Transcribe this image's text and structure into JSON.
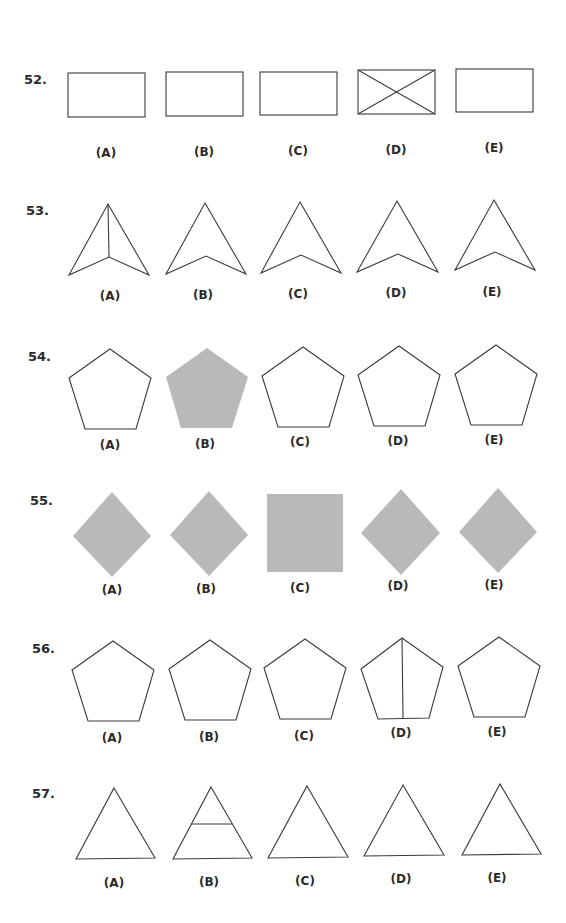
{
  "page": {
    "width": 566,
    "height": 923,
    "background": "#ffffff"
  },
  "colors": {
    "stroke": "#3a3a3a",
    "fill_gray": "#b9b9b9",
    "text": "#2a2a2a"
  },
  "questions": [
    {
      "number": "52.",
      "num_pos": [
        24,
        84
      ],
      "options": [
        {
          "label": "(A)",
          "label_pos": [
            106,
            157
          ],
          "shape": "rect",
          "style": "outline",
          "geom": [
            68,
            73,
            77,
            44
          ],
          "extra": []
        },
        {
          "label": "(B)",
          "label_pos": [
            204,
            156
          ],
          "shape": "rect",
          "style": "outline",
          "geom": [
            166,
            72,
            77,
            44
          ],
          "extra": []
        },
        {
          "label": "(C)",
          "label_pos": [
            298,
            155
          ],
          "shape": "rect",
          "style": "outline",
          "geom": [
            260,
            72,
            77,
            43
          ],
          "extra": []
        },
        {
          "label": "(D)",
          "label_pos": [
            396,
            154
          ],
          "shape": "rect",
          "style": "outline",
          "geom": [
            358,
            70,
            77,
            44
          ],
          "extra": [
            [
              358,
              70,
              435,
              114
            ],
            [
              435,
              70,
              358,
              114
            ]
          ]
        },
        {
          "label": "(E)",
          "label_pos": [
            494,
            152
          ],
          "shape": "rect",
          "style": "outline",
          "geom": [
            456,
            69,
            77,
            43
          ],
          "extra": []
        }
      ]
    },
    {
      "number": "53.",
      "num_pos": [
        26,
        215
      ],
      "options": [
        {
          "label": "(A)",
          "label_pos": [
            110,
            300
          ],
          "shape": "poly",
          "style": "outline",
          "geom": [
            [
              108,
              204
            ],
            [
              149,
              275
            ],
            [
              109,
              257
            ],
            [
              69,
              275
            ]
          ],
          "extra": [
            [
              108,
              204,
              109,
              257
            ]
          ]
        },
        {
          "label": "(B)",
          "label_pos": [
            203,
            299
          ],
          "shape": "poly",
          "style": "outline",
          "geom": [
            [
              205,
              203
            ],
            [
              246,
              274
            ],
            [
              206,
              256
            ],
            [
              166,
              274
            ]
          ],
          "extra": []
        },
        {
          "label": "(C)",
          "label_pos": [
            298,
            298
          ],
          "shape": "poly",
          "style": "outline",
          "geom": [
            [
              300,
              202
            ],
            [
              341,
              273
            ],
            [
              301,
              255
            ],
            [
              261,
              273
            ]
          ],
          "extra": []
        },
        {
          "label": "(D)",
          "label_pos": [
            396,
            297
          ],
          "shape": "poly",
          "style": "outline",
          "geom": [
            [
              397,
              201
            ],
            [
              438,
              272
            ],
            [
              398,
              254
            ],
            [
              357,
              272
            ]
          ],
          "extra": []
        },
        {
          "label": "(E)",
          "label_pos": [
            492,
            296
          ],
          "shape": "poly",
          "style": "outline",
          "geom": [
            [
              494,
              200
            ],
            [
              535,
              270
            ],
            [
              495,
              252
            ],
            [
              455,
              270
            ]
          ],
          "extra": []
        }
      ]
    },
    {
      "number": "54.",
      "num_pos": [
        28,
        361
      ],
      "options": [
        {
          "label": "(A)",
          "label_pos": [
            110,
            449
          ],
          "shape": "poly",
          "style": "outline",
          "geom": [
            [
              110,
              349
            ],
            [
              151,
              378
            ],
            [
              136,
              429
            ],
            [
              85,
              429
            ],
            [
              69,
              378
            ]
          ],
          "extra": []
        },
        {
          "label": "(B)",
          "label_pos": [
            205,
            448
          ],
          "shape": "poly",
          "style": "filled",
          "geom": [
            [
              207,
              348
            ],
            [
              248,
              377
            ],
            [
              232,
              428
            ],
            [
              181,
              428
            ],
            [
              166,
              377
            ]
          ],
          "extra": []
        },
        {
          "label": "(C)",
          "label_pos": [
            300,
            446
          ],
          "shape": "poly",
          "style": "outline",
          "geom": [
            [
              303,
              347
            ],
            [
              344,
              376
            ],
            [
              329,
              427
            ],
            [
              278,
              427
            ],
            [
              262,
              376
            ]
          ],
          "extra": []
        },
        {
          "label": "(D)",
          "label_pos": [
            398,
            445
          ],
          "shape": "poly",
          "style": "outline",
          "geom": [
            [
              399,
              346
            ],
            [
              440,
              375
            ],
            [
              425,
              426
            ],
            [
              374,
              426
            ],
            [
              358,
              375
            ]
          ],
          "extra": []
        },
        {
          "label": "(E)",
          "label_pos": [
            494,
            444
          ],
          "shape": "poly",
          "style": "outline",
          "geom": [
            [
              496,
              345
            ],
            [
              537,
              374
            ],
            [
              522,
              425
            ],
            [
              471,
              425
            ],
            [
              455,
              374
            ]
          ],
          "extra": []
        }
      ]
    },
    {
      "number": "55.",
      "num_pos": [
        30,
        505
      ],
      "options": [
        {
          "label": "(A)",
          "label_pos": [
            112,
            594
          ],
          "shape": "poly",
          "style": "filled",
          "geom": [
            [
              112,
              492
            ],
            [
              151,
              536
            ],
            [
              112,
              577
            ],
            [
              73,
              536
            ]
          ],
          "extra": []
        },
        {
          "label": "(B)",
          "label_pos": [
            206,
            593
          ],
          "shape": "poly",
          "style": "filled",
          "geom": [
            [
              209,
              491
            ],
            [
              248,
              535
            ],
            [
              209,
              576
            ],
            [
              170,
              535
            ]
          ],
          "extra": []
        },
        {
          "label": "(C)",
          "label_pos": [
            300,
            592
          ],
          "shape": "rect",
          "style": "filled",
          "geom": [
            267,
            494,
            76,
            78
          ],
          "extra": []
        },
        {
          "label": "(D)",
          "label_pos": [
            398,
            590
          ],
          "shape": "poly",
          "style": "filled",
          "geom": [
            [
              401,
              489
            ],
            [
              440,
              533
            ],
            [
              401,
              575
            ],
            [
              361,
              533
            ]
          ],
          "extra": []
        },
        {
          "label": "(E)",
          "label_pos": [
            494,
            589
          ],
          "shape": "poly",
          "style": "filled",
          "geom": [
            [
              498,
              488
            ],
            [
              537,
              532
            ],
            [
              498,
              573
            ],
            [
              459,
              532
            ]
          ],
          "extra": []
        }
      ]
    },
    {
      "number": "56.",
      "num_pos": [
        32,
        653
      ],
      "options": [
        {
          "label": "(A)",
          "label_pos": [
            112,
            742
          ],
          "shape": "poly",
          "style": "outline",
          "geom": [
            [
              113,
              641
            ],
            [
              154,
              670
            ],
            [
              139,
              721
            ],
            [
              88,
              721
            ],
            [
              72,
              670
            ]
          ],
          "extra": []
        },
        {
          "label": "(B)",
          "label_pos": [
            209,
            741
          ],
          "shape": "poly",
          "style": "outline",
          "geom": [
            [
              210,
              640
            ],
            [
              251,
              669
            ],
            [
              236,
              720
            ],
            [
              185,
              720
            ],
            [
              169,
              669
            ]
          ],
          "extra": []
        },
        {
          "label": "(C)",
          "label_pos": [
            304,
            740
          ],
          "shape": "poly",
          "style": "outline",
          "geom": [
            [
              305,
              639
            ],
            [
              346,
              668
            ],
            [
              331,
              719
            ],
            [
              280,
              719
            ],
            [
              264,
              668
            ]
          ],
          "extra": []
        },
        {
          "label": "(D)",
          "label_pos": [
            401,
            737
          ],
          "shape": "poly",
          "style": "outline",
          "geom": [
            [
              402,
              638
            ],
            [
              443,
              667
            ],
            [
              429,
              718
            ],
            [
              378,
              719
            ],
            [
              361,
              669
            ]
          ],
          "extra": [
            [
              402,
              638,
              403,
              718
            ]
          ]
        },
        {
          "label": "(E)",
          "label_pos": [
            497,
            736
          ],
          "shape": "poly",
          "style": "outline",
          "geom": [
            [
              499,
              637
            ],
            [
              540,
              666
            ],
            [
              525,
              717
            ],
            [
              474,
              717
            ],
            [
              458,
              666
            ]
          ],
          "extra": []
        }
      ]
    },
    {
      "number": "57.",
      "num_pos": [
        32,
        798
      ],
      "options": [
        {
          "label": "(A)",
          "label_pos": [
            114,
            887
          ],
          "shape": "poly",
          "style": "outline",
          "geom": [
            [
              114,
              788
            ],
            [
              155,
              858
            ],
            [
              76,
              859
            ]
          ],
          "extra": []
        },
        {
          "label": "(B)",
          "label_pos": [
            209,
            886
          ],
          "shape": "poly",
          "style": "outline",
          "geom": [
            [
              211,
              787
            ],
            [
              252,
              858
            ],
            [
              173,
              859
            ]
          ],
          "extra": [
            [
              191,
              824,
              232,
              824
            ]
          ]
        },
        {
          "label": "(C)",
          "label_pos": [
            305,
            885
          ],
          "shape": "poly",
          "style": "outline",
          "geom": [
            [
              307,
              786
            ],
            [
              348,
              857
            ],
            [
              268,
              858
            ]
          ],
          "extra": []
        },
        {
          "label": "(D)",
          "label_pos": [
            401,
            883
          ],
          "shape": "poly",
          "style": "outline",
          "geom": [
            [
              403,
              785
            ],
            [
              444,
              855
            ],
            [
              364,
              856
            ]
          ],
          "extra": []
        },
        {
          "label": "(E)",
          "label_pos": [
            497,
            882
          ],
          "shape": "poly",
          "style": "outline",
          "geom": [
            [
              500,
              784
            ],
            [
              541,
              854
            ],
            [
              462,
              855
            ]
          ],
          "extra": []
        }
      ]
    }
  ]
}
